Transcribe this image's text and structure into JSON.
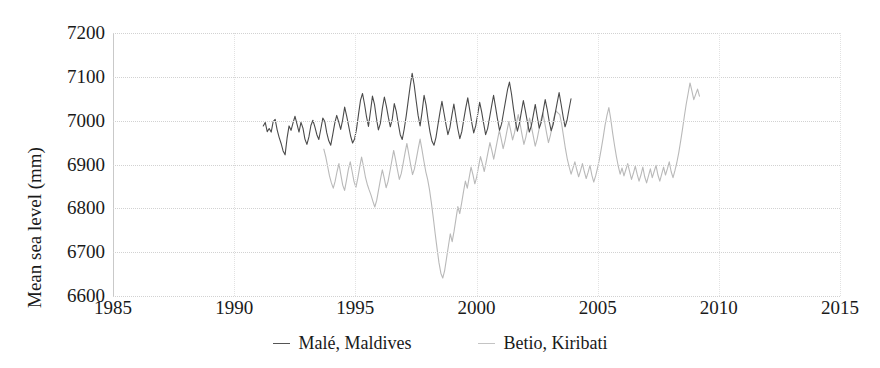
{
  "chart_data": {
    "type": "line",
    "title": "",
    "xlabel": "",
    "ylabel": "Mean sea level (mm)",
    "xlim": [
      1985,
      2015
    ],
    "ylim": [
      6600,
      7200
    ],
    "xticks": [
      1985,
      1990,
      1995,
      2000,
      2005,
      2010,
      2015
    ],
    "yticks": [
      6600,
      6700,
      6800,
      6900,
      7000,
      7100,
      7200
    ],
    "grid": "horizontal dotted gridlines at each y tick, faint vertical dotted lines at each x tick",
    "legend_position": "bottom-center",
    "series": [
      {
        "name": "Malé, Maldives",
        "color": "#4a4a4a",
        "x_start": 1991.2,
        "x_end": 2003.9,
        "values": [
          6988,
          6996,
          6975,
          6982,
          6974,
          6998,
          7003,
          6979,
          6962,
          6948,
          6931,
          6922,
          6960,
          6988,
          6978,
          6995,
          7010,
          6992,
          6974,
          6996,
          6983,
          6958,
          6946,
          6963,
          6989,
          7001,
          6986,
          6968,
          6957,
          6981,
          7006,
          6998,
          6972,
          6954,
          6944,
          6968,
          6994,
          7012,
          6997,
          6980,
          7002,
          7031,
          7011,
          6988,
          6965,
          6949,
          6958,
          6982,
          7015,
          7047,
          7062,
          7038,
          7009,
          6987,
          7021,
          7056,
          7038,
          7006,
          6979,
          6994,
          7028,
          7054,
          7033,
          7008,
          6986,
          7004,
          7039,
          7021,
          6993,
          6968,
          6957,
          6981,
          7011,
          7045,
          7079,
          7108,
          7082,
          7046,
          7012,
          6988,
          7020,
          7058,
          7036,
          7002,
          6974,
          6953,
          6944,
          6962,
          6991,
          7019,
          7044,
          7018,
          6992,
          6968,
          6984,
          7012,
          7038,
          7009,
          6981,
          6959,
          6975,
          7003,
          7029,
          7052,
          7024,
          6996,
          6972,
          6988,
          7014,
          7042,
          7020,
          6994,
          6968,
          6982,
          7007,
          7033,
          7058,
          7031,
          7003,
          6978,
          6992,
          7018,
          7044,
          7070,
          7088,
          7062,
          7028,
          6998,
          6976,
          6994,
          7020,
          7046,
          7023,
          6998,
          6974,
          6988,
          7012,
          7037,
          7009,
          6983,
          6996,
          7022,
          7048,
          7026,
          6999,
          6977,
          6991,
          7016,
          7040,
          7064,
          7038,
          7010,
          6986,
          7001,
          7026,
          7050
        ]
      },
      {
        "name": "Betio, Kiribati",
        "color": "#b9b9b9",
        "x_start": 1993.7,
        "x_end": 2009.2,
        "values": [
          6935,
          6918,
          6896,
          6874,
          6858,
          6846,
          6862,
          6884,
          6902,
          6877,
          6853,
          6841,
          6864,
          6889,
          6906,
          6884,
          6861,
          6848,
          6869,
          6894,
          6917,
          6896,
          6872,
          6855,
          6842,
          6830,
          6816,
          6803,
          6818,
          6842,
          6866,
          6888,
          6869,
          6847,
          6861,
          6884,
          6908,
          6932,
          6911,
          6888,
          6866,
          6879,
          6902,
          6926,
          6948,
          6924,
          6899,
          6877,
          6890,
          6913,
          6936,
          6958,
          6934,
          6908,
          6884,
          6866,
          6842,
          6812,
          6778,
          6742,
          6708,
          6676,
          6652,
          6641,
          6658,
          6686,
          6714,
          6742,
          6724,
          6748,
          6776,
          6804,
          6788,
          6812,
          6838,
          6862,
          6846,
          6870,
          6894,
          6877,
          6856,
          6872,
          6896,
          6918,
          6902,
          6884,
          6906,
          6928,
          6950,
          6932,
          6912,
          6934,
          6956,
          6978,
          6958,
          6936,
          6954,
          6976,
          6998,
          6978,
          6956,
          6972,
          6994,
          7014,
          6992,
          6968,
          6946,
          6962,
          6984,
          7006,
          6986,
          6964,
          6942,
          6958,
          6980,
          7001,
          7018,
          6996,
          6972,
          6950,
          6966,
          6988,
          7009,
          7022,
          7018,
          7014,
          6992,
          6964,
          6936,
          6912,
          6894,
          6878,
          6892,
          6906,
          6888,
          6872,
          6886,
          6902,
          6884,
          6868,
          6882,
          6898,
          6876,
          6860,
          6874,
          6892,
          6912,
          6936,
          6962,
          6990,
          7012,
          7030,
          7004,
          6972,
          6944,
          6918,
          6896,
          6878,
          6892,
          6874,
          6888,
          6902,
          6884,
          6866,
          6880,
          6896,
          6878,
          6862,
          6876,
          6894,
          6872,
          6858,
          6874,
          6890,
          6870,
          6884,
          6898,
          6876,
          6862,
          6878,
          6894,
          6876,
          6890,
          6906,
          6884,
          6870,
          6886,
          6904,
          6926,
          6952,
          6980,
          7010,
          7038,
          7062,
          7086,
          7068,
          7048,
          7060,
          7072,
          7056
        ]
      }
    ]
  },
  "axis": {
    "y_title": "Mean sea level (mm)",
    "y_tick_labels": [
      "7200",
      "7100",
      "7000",
      "6900",
      "6800",
      "6700",
      "6600"
    ],
    "x_tick_labels": [
      "1985",
      "1990",
      "1995",
      "2000",
      "2005",
      "2010",
      "2015"
    ]
  },
  "legend": {
    "items": [
      {
        "label": "Malé, Maldives",
        "color": "#4a4a4a"
      },
      {
        "label": "Betio, Kiribati",
        "color": "#b9b9b9"
      }
    ]
  },
  "colors": {
    "male_line": "#4a4a4a",
    "betio_line": "#b9b9b9",
    "gridline": "#d2d2d2",
    "axis": "#c9c9c9",
    "text": "#1a1a1a",
    "background": "#ffffff"
  }
}
